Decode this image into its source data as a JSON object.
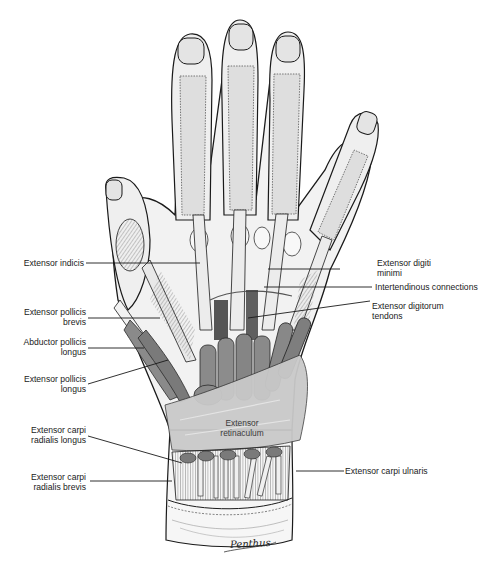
{
  "figure": {
    "signature": "Penthus",
    "center_label": {
      "line1": "Extensor",
      "line2": "retinaculum"
    }
  },
  "labels_left": [
    {
      "id": "extensor-indicis",
      "line1": "Extensor indicis",
      "line2": ""
    },
    {
      "id": "extensor-pollicis-brevis",
      "line1": "Extensor pollicis",
      "line2": "brevis"
    },
    {
      "id": "abductor-pollicis-longus",
      "line1": "Abductor pollicis",
      "line2": "longus"
    },
    {
      "id": "extensor-pollicis-longus",
      "line1": "Extensor pollicis",
      "line2": "longus"
    },
    {
      "id": "extensor-carpi-radialis-longus",
      "line1": "Extensor carpi",
      "line2": "radialis longus"
    },
    {
      "id": "extensor-carpi-radialis-brevis",
      "line1": "Extensor carpi",
      "line2": "radialis brevis"
    }
  ],
  "labels_right": [
    {
      "id": "extensor-digiti-minimi",
      "line1": "Extensor digiti",
      "line2": "minimi"
    },
    {
      "id": "intertendinous-connections",
      "line1": "Intertendinous connections",
      "line2": ""
    },
    {
      "id": "extensor-digitorum-tendons",
      "line1": "Extensor digitorum",
      "line2": "tendons"
    },
    {
      "id": "extensor-carpi-ulnaris",
      "line1": "Extensor carpi ulnaris",
      "line2": ""
    }
  ],
  "colors": {
    "ink": "#1a1a1a",
    "skin": "#f4f4f4",
    "tendon": "#e6e6e6",
    "muscle": "#8a8a8a",
    "muscle_dark": "#5e5e5e",
    "retinaculum": "#c9c9c9",
    "shadow": "#3a3a3a"
  }
}
